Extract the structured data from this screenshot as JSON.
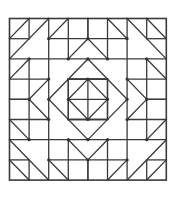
{
  "diagram": {
    "type": "quilt-block",
    "grid_size": 8,
    "origin": [
      9.5,
      18.5
    ],
    "cell": [
      19.6,
      20.2
    ],
    "stroke_color": "#3a3a3a",
    "stroke_width": 1.3,
    "node_color": "#333333",
    "background": "#ffffff",
    "quadrant_lines": [
      [
        0,
        1,
        1,
        1
      ],
      [
        2,
        1,
        4,
        1
      ],
      [
        1,
        0,
        1,
        1
      ],
      [
        1,
        2,
        1,
        4
      ],
      [
        0,
        2,
        4,
        2
      ],
      [
        2,
        0,
        2,
        4
      ],
      [
        3,
        0,
        3,
        2
      ],
      [
        3,
        3,
        3,
        4
      ],
      [
        0,
        3,
        2,
        3
      ],
      [
        3,
        3,
        4,
        3
      ],
      [
        4,
        0,
        4,
        1
      ],
      [
        0,
        4,
        1,
        4
      ],
      [
        3,
        3,
        4,
        3
      ]
    ],
    "quadrant_diagonals": [
      [
        0,
        1,
        1,
        0
      ],
      [
        0,
        2,
        2,
        0
      ],
      [
        2,
        1,
        3,
        0
      ],
      [
        3,
        2,
        4,
        1
      ],
      [
        0,
        3,
        1,
        2
      ],
      [
        1,
        4,
        2,
        3
      ],
      [
        2,
        4,
        4,
        2
      ],
      [
        3,
        4,
        4,
        3
      ]
    ]
  }
}
